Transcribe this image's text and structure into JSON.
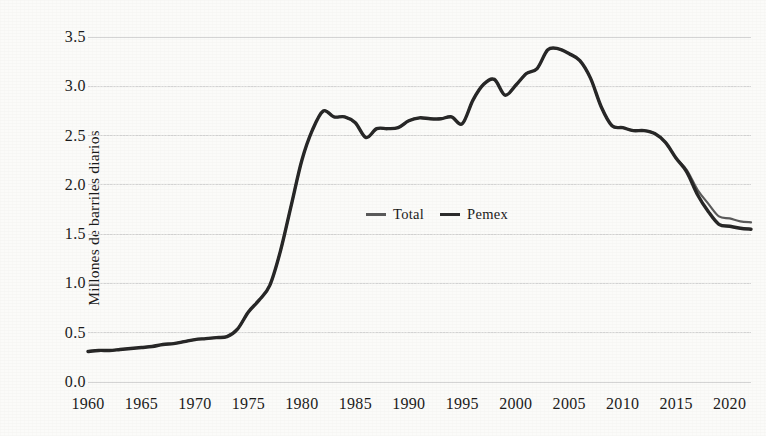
{
  "chart_data": {
    "type": "line",
    "title": "",
    "subtitle": "",
    "xlabel": "",
    "ylabel": "Millones de barriles diarios",
    "xlim": [
      1960,
      2022
    ],
    "ylim": [
      0.0,
      3.5
    ],
    "grid": true,
    "legend_position": "center",
    "y_ticks": [
      "0.0",
      "0.5",
      "1.0",
      "1.5",
      "2.0",
      "2.5",
      "3.0",
      "3.5"
    ],
    "y_tick_values": [
      0.0,
      0.5,
      1.0,
      1.5,
      2.0,
      2.5,
      3.0,
      3.5
    ],
    "x_ticks": [
      "1960",
      "1965",
      "1970",
      "1975",
      "1980",
      "1985",
      "1990",
      "1995",
      "2000",
      "2005",
      "2010",
      "2015",
      "2020"
    ],
    "x_tick_values": [
      1960,
      1965,
      1970,
      1975,
      1980,
      1985,
      1990,
      1995,
      2000,
      2005,
      2010,
      2015,
      2020
    ],
    "x": [
      1960,
      1961,
      1962,
      1963,
      1964,
      1965,
      1966,
      1967,
      1968,
      1969,
      1970,
      1971,
      1972,
      1973,
      1974,
      1975,
      1976,
      1977,
      1978,
      1979,
      1980,
      1981,
      1982,
      1983,
      1984,
      1985,
      1986,
      1987,
      1988,
      1989,
      1990,
      1991,
      1992,
      1993,
      1994,
      1995,
      1996,
      1997,
      1998,
      1999,
      2000,
      2001,
      2002,
      2003,
      2004,
      2005,
      2006,
      2007,
      2008,
      2009,
      2010,
      2011,
      2012,
      2013,
      2014,
      2015,
      2016,
      2017,
      2018,
      2019,
      2020,
      2021,
      2022
    ],
    "series": [
      {
        "name": "Total",
        "color": "#5a5a5a",
        "width": 2.2,
        "values": [
          0.31,
          0.32,
          0.32,
          0.33,
          0.34,
          0.35,
          0.36,
          0.38,
          0.39,
          0.41,
          0.43,
          0.44,
          0.45,
          0.46,
          0.54,
          0.71,
          0.83,
          0.98,
          1.33,
          1.79,
          2.25,
          2.56,
          2.75,
          2.69,
          2.69,
          2.63,
          2.48,
          2.57,
          2.57,
          2.58,
          2.65,
          2.68,
          2.67,
          2.67,
          2.69,
          2.62,
          2.86,
          3.02,
          3.07,
          2.91,
          3.01,
          3.13,
          3.18,
          3.37,
          3.38,
          3.33,
          3.26,
          3.08,
          2.79,
          2.6,
          2.58,
          2.55,
          2.55,
          2.52,
          2.43,
          2.27,
          2.15,
          1.95,
          1.81,
          1.68,
          1.66,
          1.63,
          1.62
        ]
      },
      {
        "name": "Pemex",
        "color": "#262626",
        "width": 3.4,
        "values": [
          0.31,
          0.32,
          0.32,
          0.33,
          0.34,
          0.35,
          0.36,
          0.38,
          0.39,
          0.41,
          0.43,
          0.44,
          0.45,
          0.46,
          0.54,
          0.71,
          0.83,
          0.98,
          1.33,
          1.79,
          2.25,
          2.56,
          2.75,
          2.69,
          2.69,
          2.63,
          2.48,
          2.57,
          2.57,
          2.58,
          2.65,
          2.68,
          2.67,
          2.67,
          2.69,
          2.62,
          2.86,
          3.02,
          3.07,
          2.91,
          3.01,
          3.13,
          3.18,
          3.37,
          3.38,
          3.33,
          3.26,
          3.08,
          2.79,
          2.6,
          2.58,
          2.55,
          2.55,
          2.52,
          2.43,
          2.27,
          2.13,
          1.9,
          1.73,
          1.6,
          1.58,
          1.56,
          1.55
        ]
      }
    ],
    "annotations": []
  },
  "legend": {
    "entries": [
      {
        "label": "Total"
      },
      {
        "label": "Pemex"
      }
    ]
  },
  "axis": {
    "y_title": "Millones de barriles diarios"
  },
  "colors": {
    "background": "#fbfbf9",
    "grid": "#c9c9c9",
    "text": "#1a1a1a",
    "total_line": "#5a5a5a",
    "pemex_line": "#262626"
  }
}
